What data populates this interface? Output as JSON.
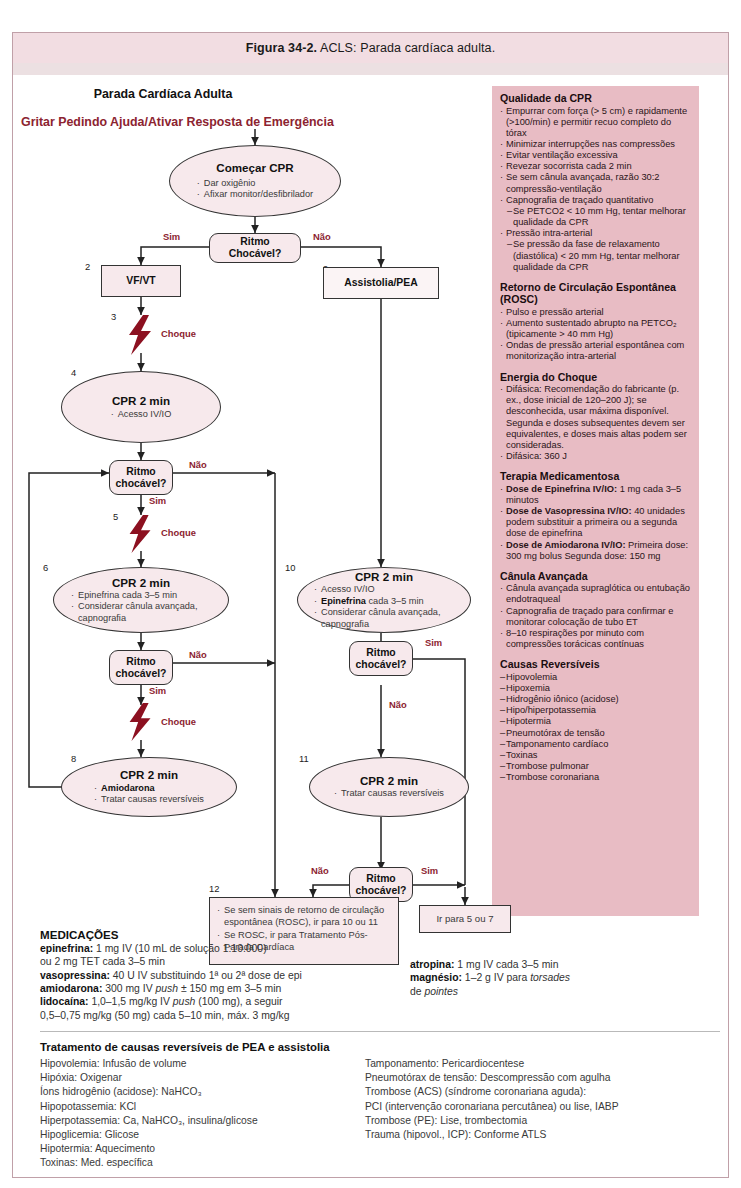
{
  "caption": {
    "label": "Figura 34-2.",
    "text": " ACLS: Parada cardíaca adulta."
  },
  "flow": {
    "main_title": "Parada Cardíaca Adulta",
    "red_title": "Gritar Pedindo Ajuda/Ativar Resposta de Emergência",
    "n1": {
      "title": "Começar CPR",
      "b1": "Dar oxigênio",
      "b2": "Afixar monitor/desfibrilador"
    },
    "d1": {
      "l1": "Ritmo",
      "l2": "Chocável?"
    },
    "yes": "Sim",
    "no": "Não",
    "n2": {
      "num": "2",
      "title": "VF/VT"
    },
    "n9": {
      "num": "9",
      "title": "Assistolia/PEA"
    },
    "n3": {
      "num": "3",
      "label": "Choque"
    },
    "n4": {
      "num": "4",
      "title": "CPR 2 min",
      "b1": "Acesso IV/IO"
    },
    "d2": {
      "l1": "Ritmo",
      "l2": "chocável?"
    },
    "n5": {
      "num": "5",
      "label": "Choque"
    },
    "n6": {
      "num": "6",
      "title": "CPR 2 min",
      "b1": "Epinefrina cada 3–5 min",
      "b2": "Considerar cânula avançada, capnografia"
    },
    "d3": {
      "l1": "Ritmo",
      "l2": "chocável?"
    },
    "n7": {
      "label": "Choque"
    },
    "n8": {
      "num": "8",
      "title": "CPR 2 min",
      "b1": "Amiodarona",
      "b2": "Tratar causas reversíveis"
    },
    "n10": {
      "num": "10",
      "title": "CPR 2 min",
      "b1": "Acesso IV/IO",
      "b2b": "Epinefrina",
      "b2": " cada 3–5 min",
      "b3": "Considerar cânula avançada, capnografia"
    },
    "d4": {
      "l1": "Ritmo",
      "l2": "chocável?"
    },
    "n11": {
      "num": "11",
      "title": "CPR 2 min",
      "b1": "Tratar causas reversíveis"
    },
    "d5": {
      "l1": "Ritmo",
      "l2": "chocável?"
    },
    "n12": {
      "num": "12",
      "b1": "Se sem sinais de retorno de circulação espontânea (ROSC), ir para 10 ou 11",
      "b2": "Se ROSC, ir para Tratamento Pós-Parada Cardíaca"
    },
    "goto": "Ir para 5 ou 7"
  },
  "sidebar": {
    "sections": [
      {
        "heading": "Qualidade da CPR",
        "items": [
          {
            "bullet": "·",
            "text": "Empurrar com força (> 5 cm) e rapidamente (>100/min) e permitir recuo completo do tórax"
          },
          {
            "bullet": "·",
            "text": "Minimizar interrupções nas compressões"
          },
          {
            "bullet": "·",
            "text": "Evitar ventilação excessiva"
          },
          {
            "bullet": "·",
            "text": "Revezar socorrista cada 2 min"
          },
          {
            "bullet": "·",
            "text": "Se sem cânula avançada, razão 30:2 compressão-ventilação"
          },
          {
            "bullet": "·",
            "text": "Capnografia de traçado quantitativo"
          },
          {
            "bullet": "–",
            "text": "Se PETCO2 < 10 mm Hg, tentar melhorar qualidade da CPR",
            "sub": true
          },
          {
            "bullet": "·",
            "text": "Pressão intra-arterial"
          },
          {
            "bullet": "–",
            "text": "Se pressão da fase de relaxamento (diastólica) < 20 mm Hg, tentar melhorar qualidade da CPR",
            "sub": true
          }
        ]
      },
      {
        "heading": "Retorno de Circulação Espontânea (ROSC)",
        "items": [
          {
            "bullet": "·",
            "text": "Pulso e pressão arterial"
          },
          {
            "bullet": "·",
            "text": "Aumento sustentado abrupto na PETCO₂ (tipicamente > 40 mm Hg)"
          },
          {
            "bullet": "·",
            "text": "Ondas de pressão arterial espontânea com monitorização intra-arterial"
          }
        ]
      },
      {
        "heading": "Energia do Choque",
        "items": [
          {
            "bullet": "·",
            "text": "Difásica: Recomendação do fabricante (p. ex., dose inicial de 120–200 J); se desconhecida, usar máxima disponível. Segunda e doses subsequentes devem ser equivalentes, e doses mais altas podem ser consideradas."
          },
          {
            "bullet": "·",
            "text": "Difásica: 360 J"
          }
        ]
      },
      {
        "heading": "Terapia Medicamentosa",
        "items": [
          {
            "bullet": "·",
            "bold": "Dose de Epinefrina IV/IO:",
            "text": " 1 mg cada 3–5 minutos"
          },
          {
            "bullet": "·",
            "bold": "Dose de Vasopressina IV/IO:",
            "text": " 40 unidades podem substituir a primeira ou a segunda dose de epinefrina"
          },
          {
            "bullet": "·",
            "bold": "Dose de Amiodarona IV/IO:",
            "text": " Primeira dose: 300 mg bolus Segunda dose: 150 mg"
          }
        ]
      },
      {
        "heading": "Cânula Avançada",
        "items": [
          {
            "bullet": "·",
            "text": "Cânula avançada supraglótica ou entubação endotraqueal"
          },
          {
            "bullet": "·",
            "text": "Capnografia de traçado para confirmar e monitorar colocação de tubo ET"
          },
          {
            "bullet": "·",
            "text": "8–10 respirações por minuto com compressões torácicas contínuas"
          }
        ]
      },
      {
        "heading": "Causas Reversíveis",
        "items": [
          {
            "bullet": "–",
            "text": "Hipovolemia"
          },
          {
            "bullet": "–",
            "text": "Hipoxemia"
          },
          {
            "bullet": "–",
            "text": "Hidrogênio iônico (acidose)"
          },
          {
            "bullet": "–",
            "text": "Hipo/hiperpotassemia"
          },
          {
            "bullet": "–",
            "text": "Hipotermia"
          },
          {
            "bullet": "–",
            "text": "Pneumotórax de tensão"
          },
          {
            "bullet": "–",
            "text": "Tamponamento cardíaco"
          },
          {
            "bullet": "–",
            "text": "Toxinas"
          },
          {
            "bullet": "–",
            "text": "Trombose pulmonar"
          },
          {
            "bullet": "–",
            "text": "Trombose coronariana"
          }
        ]
      }
    ]
  },
  "medications": {
    "heading": "MEDICAÇÕES",
    "left_lines": [
      {
        "bold": "epinefrina:",
        "text": " 1 mg IV (10 mL de solução 1:10.000)"
      },
      {
        "bold": "",
        "text": "ou 2 mg TET cada 3–5 min"
      },
      {
        "bold": "vasopressina:",
        "text": " 40 U IV substituindo 1ª ou 2ª dose de epi"
      },
      {
        "bold": "amiodarona:",
        "text": " 300 mg IV push ± 150 mg em 3–5 min"
      },
      {
        "bold": "lidocaína:",
        "text": " 1,0–1,5 mg/kg IV push (100 mg), a seguir"
      },
      {
        "bold": "",
        "text": "0,5–0,75 mg/kg (50 mg) cada 5–10 min, máx. 3 mg/kg"
      }
    ],
    "right_lines": [
      {
        "bold": "atropina:",
        "text": " 1 mg IV cada 3–5 min"
      },
      {
        "bold": "magnésio:",
        "text": " 1–2 g IV para torsades"
      },
      {
        "bold": "",
        "text": "de pointes"
      }
    ]
  },
  "treatment": {
    "heading": "Tratamento de causas reversíveis de PEA e assistolia",
    "left_lines": [
      "Hipovolemia: Infusão de volume",
      "Hipóxia: Oxigenar",
      "Íons hidrogênio (acidose): NaHCO₃",
      "Hipopotassemia: KCl",
      "Hiperpotassemia: Ca, NaHCO₃, insulina/glicose",
      "Hipoglicemia: Glicose",
      "Hipotermia: Aquecimento",
      "Toxinas: Med. específica"
    ],
    "right_lines": [
      "Tamponamento: Pericardiocentese",
      "Pneumotórax de tensão: Descompressão com agulha",
      "Trombose (ACS) (síndrome coronariana aguda):",
      "PCI (intervenção coronariana percutânea) ou lise, IABP",
      "Trombose (PE): Lise, trombectomia",
      "Trauma (hipovol., ICP): Conforme ATLS"
    ]
  },
  "colors": {
    "accent_red": "#8c2330",
    "sidebar_bg": "#e8bcc4",
    "node_fill": "#f7e9ec",
    "caption_bg": "#f2dde2"
  }
}
